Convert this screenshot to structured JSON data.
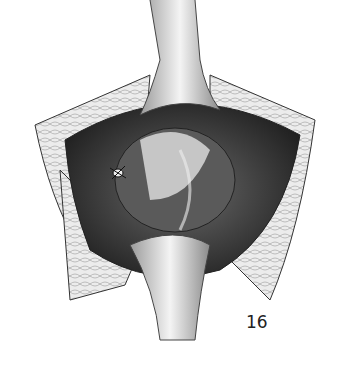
{
  "figure": {
    "figure_number": "16",
    "colors": {
      "background": "#ffffff",
      "ink": "#222222",
      "fat_tissue": "#e6e6e6",
      "cavity": "#3a3a3a"
    }
  }
}
